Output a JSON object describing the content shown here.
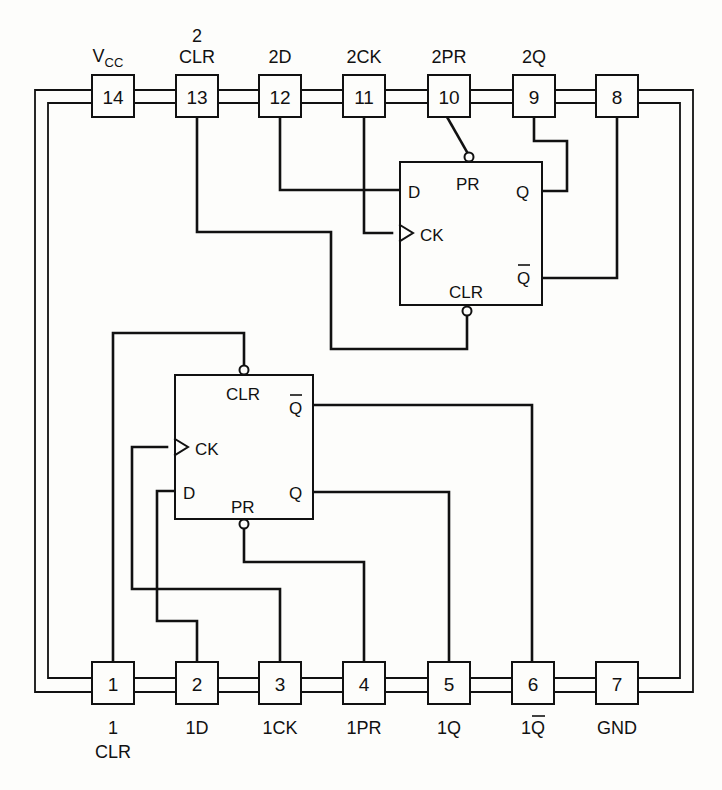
{
  "diagram": {
    "type": "ic-pinout",
    "top_pins": [
      {
        "number": "14",
        "label_line1": "",
        "label_line2": "V",
        "label_sub": "CC"
      },
      {
        "number": "13",
        "label_line1": "2",
        "label_line2": "CLR",
        "label_sub": ""
      },
      {
        "number": "12",
        "label_line1": "",
        "label_line2": "2D",
        "label_sub": ""
      },
      {
        "number": "11",
        "label_line1": "",
        "label_line2": "2CK",
        "label_sub": ""
      },
      {
        "number": "10",
        "label_line1": "",
        "label_line2": "2PR",
        "label_sub": ""
      },
      {
        "number": "9",
        "label_line1": "",
        "label_line2": "2Q",
        "label_sub": ""
      },
      {
        "number": "8",
        "label_line1": "",
        "label_line2": "",
        "label_sub": ""
      }
    ],
    "bottom_pins": [
      {
        "number": "1",
        "label_line1": "1",
        "label_line2": "CLR"
      },
      {
        "number": "2",
        "label_line1": "1D",
        "label_line2": ""
      },
      {
        "number": "3",
        "label_line1": "1CK",
        "label_line2": ""
      },
      {
        "number": "4",
        "label_line1": "1PR",
        "label_line2": ""
      },
      {
        "number": "5",
        "label_line1": "1Q",
        "label_line2": ""
      },
      {
        "number": "6",
        "label_line1": "1",
        "label_overbar": "Q",
        "label_line2": ""
      },
      {
        "number": "7",
        "label_line1": "GND",
        "label_line2": ""
      }
    ],
    "flip_flops": [
      {
        "id": "ff2",
        "inputs": {
          "d": "D",
          "ck": "CK",
          "pr": "PR",
          "clr": "CLR"
        },
        "outputs": {
          "q": "Q",
          "qbar": "Q"
        }
      },
      {
        "id": "ff1",
        "inputs": {
          "d": "D",
          "ck": "CK",
          "pr": "PR",
          "clr": "CLR"
        },
        "outputs": {
          "q": "Q",
          "qbar": "Q"
        }
      }
    ],
    "connections": [
      {
        "from": "pin 13",
        "to": "FF2 CLR"
      },
      {
        "from": "pin 12",
        "to": "FF2 D"
      },
      {
        "from": "pin 11",
        "to": "FF2 CK"
      },
      {
        "from": "pin 10",
        "to": "FF2 PR"
      },
      {
        "from": "FF2 Q",
        "to": "pin 9"
      },
      {
        "from": "FF2 Q-bar",
        "to": "pin 8"
      },
      {
        "from": "pin 1",
        "to": "FF1 CLR"
      },
      {
        "from": "pin 2",
        "to": "FF1 D"
      },
      {
        "from": "pin 3",
        "to": "FF1 CK"
      },
      {
        "from": "pin 4",
        "to": "FF1 PR"
      },
      {
        "from": "FF1 Q",
        "to": "pin 5"
      },
      {
        "from": "FF1 Q-bar",
        "to": "pin 6"
      },
      {
        "from": "pin 14 (VCC)",
        "to": "power bus"
      },
      {
        "from": "pin 7 (GND)",
        "to": "ground bus"
      }
    ]
  }
}
